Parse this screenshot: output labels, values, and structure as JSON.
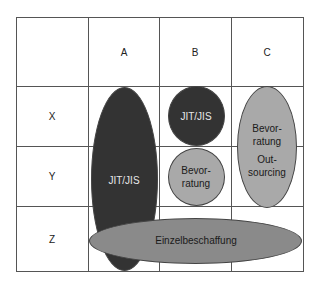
{
  "matrix": {
    "columns": [
      "A",
      "B",
      "C"
    ],
    "rows": [
      "X",
      "Y",
      "Z"
    ]
  },
  "shapes": {
    "a_column": {
      "label": "JIT/JIS",
      "color": "#333333"
    },
    "b_x": {
      "label": "JIT/JIS",
      "color": "#333333"
    },
    "b_y": {
      "label_1": "Bevor-",
      "label_2": "ratung",
      "color": "#a9a9a9"
    },
    "c_xy": {
      "label_1": "Bevor-",
      "label_2": "ratung",
      "label_3": "Out-",
      "label_4": "sourcing",
      "color": "#a9a9a9"
    },
    "z_row": {
      "label": "Einzelbeschaffung",
      "color": "#8a8a8a"
    }
  }
}
